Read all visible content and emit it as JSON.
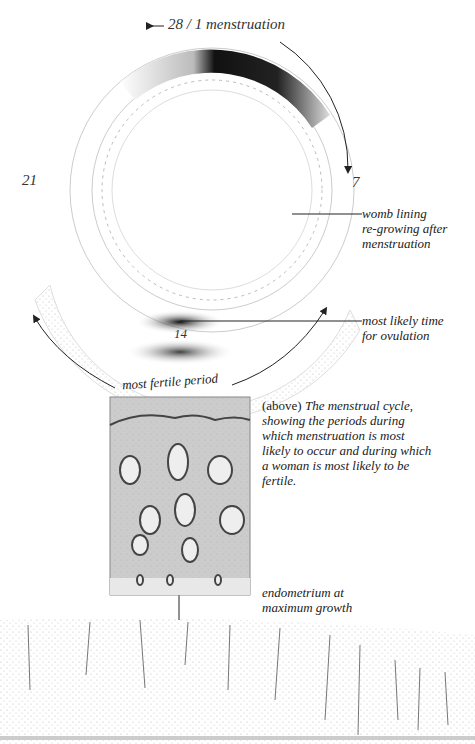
{
  "diagram": {
    "top_label": "28 / 1 menstruation",
    "day_labels": {
      "d7": "7",
      "d14": "14",
      "d21": "21"
    },
    "annotations": {
      "womb_lining": [
        "womb lining",
        "re-growing after",
        "menstruation"
      ],
      "ovulation": [
        "most likely time",
        "for ovulation"
      ],
      "fertile": "most fertile period",
      "endometrium": [
        "endometrium at",
        "maximum growth"
      ]
    },
    "caption": {
      "lead": "(above)",
      "text": "The menstrual cycle, showing the periods during which menstruation is most likely to occur and during which a woman is most likely to be fertile."
    }
  }
}
